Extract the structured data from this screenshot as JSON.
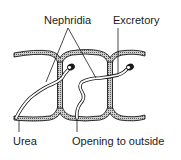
{
  "figure": {
    "type": "labeled-anatomical-diagram",
    "labels": {
      "nephridia": "Nephridia",
      "excretory": "Excretory",
      "urea": "Urea",
      "opening": "Opening to outside"
    },
    "colors": {
      "line": "#1a1a1a",
      "wall_fill": "#9a9a9a",
      "background": "#ffffff"
    }
  }
}
